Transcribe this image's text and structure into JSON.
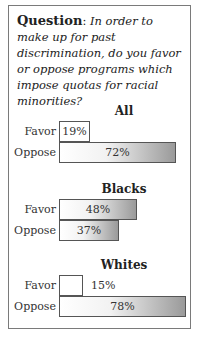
{
  "question": {
    "label": "Question",
    "separator": ": ",
    "text": "In order to make up for past discrimination, do you favor or oppose programs which impose quotas for racial minorities?"
  },
  "chart_data": {
    "type": "bar",
    "orientation": "horizontal",
    "title": "In order to make up for past discrimination, do you favor or oppose programs which impose quotas for racial minorities?",
    "categories": [
      "Favor",
      "Oppose"
    ],
    "unit": "%",
    "groups": [
      {
        "name": "All",
        "values": [
          19,
          72
        ],
        "labels": [
          "19%",
          "72%"
        ]
      },
      {
        "name": "Blacks",
        "values": [
          48,
          37
        ],
        "labels": [
          "48%",
          "37%"
        ]
      },
      {
        "name": "Whites",
        "values": [
          15,
          78
        ],
        "labels": [
          "15%",
          "78%"
        ]
      }
    ],
    "xlim": [
      0,
      100
    ],
    "grid": false,
    "legend": "none"
  }
}
